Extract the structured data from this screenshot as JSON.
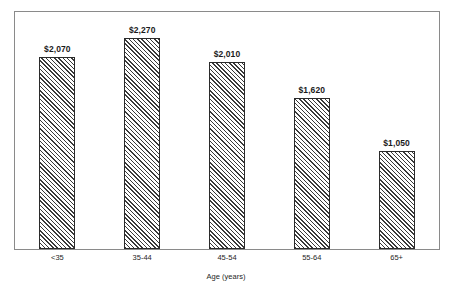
{
  "figure": {
    "ghost_title": "",
    "background_color": "#ffffff",
    "frame_color": "#8a8a8a",
    "bar_outline_color": "#2b2b2b",
    "bar_hatch_color": "#3a3a3a"
  },
  "chart_data": {
    "type": "bar",
    "title": "",
    "xlabel": "Age (years)",
    "ylabel": "",
    "categories": [
      "<35",
      "35-44",
      "45-54",
      "55-64",
      "65+"
    ],
    "values": [
      2070,
      2270,
      2010,
      1620,
      1050
    ],
    "value_labels": [
      "$2,070",
      "$2,270",
      "$2,010",
      "$1,620",
      "$1,050"
    ],
    "ylim": [
      0,
      2560
    ],
    "grid": false,
    "legend": null,
    "axis_visible": true,
    "y_ticks_visible": false,
    "orientation": "vertical",
    "bar_fill": "diagonal-hatch"
  }
}
